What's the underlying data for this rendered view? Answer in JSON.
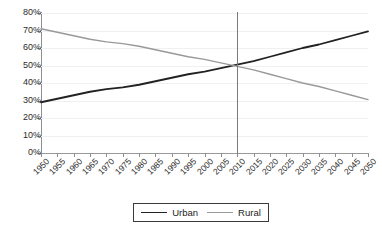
{
  "chart_data": {
    "type": "line",
    "title": "",
    "xlabel": "",
    "ylabel": "",
    "x": [
      1950,
      1955,
      1960,
      1965,
      1970,
      1975,
      1980,
      1985,
      1990,
      1995,
      2000,
      2005,
      2010,
      2015,
      2020,
      2025,
      2030,
      2035,
      2040,
      2045,
      2050
    ],
    "xticklabels": [
      "1950",
      "1955",
      "1960",
      "1965",
      "1970",
      "1975",
      "1980",
      "1985",
      "1990",
      "1995",
      "2000",
      "2005",
      "2010",
      "2015",
      "2020",
      "2025",
      "2030",
      "2035",
      "2040",
      "2045",
      "2050"
    ],
    "yticklabels": [
      "0%",
      "10%",
      "20%",
      "30%",
      "40%",
      "50%",
      "60%",
      "70%",
      "80%"
    ],
    "ytickvalues": [
      0,
      10,
      20,
      30,
      40,
      50,
      60,
      70,
      80
    ],
    "ylim": [
      0,
      80
    ],
    "xlim": [
      1950,
      2050
    ],
    "grid": true,
    "legend_position": "bottom-center",
    "series": [
      {
        "name": "Urban",
        "color": "#222222",
        "width": 1.8,
        "values": [
          29.0,
          31.0,
          33.0,
          35.0,
          36.5,
          37.5,
          39.0,
          41.0,
          43.0,
          45.0,
          46.5,
          48.5,
          50.5,
          52.5,
          55.0,
          57.5,
          60.0,
          62.0,
          64.5,
          67.0,
          69.5
        ]
      },
      {
        "name": "Rural",
        "color": "#999999",
        "width": 1.4,
        "values": [
          71.0,
          69.0,
          67.0,
          65.0,
          63.5,
          62.5,
          61.0,
          59.0,
          57.0,
          55.0,
          53.5,
          51.5,
          49.5,
          47.5,
          45.0,
          42.5,
          40.0,
          38.0,
          35.5,
          33.0,
          30.5
        ]
      }
    ],
    "annotations": [
      {
        "name": "crossover-marker",
        "type": "vline",
        "x": 2010,
        "value": 2010,
        "color": "#7a7a7a"
      }
    ]
  },
  "legend": {
    "entries": [
      {
        "label": "Urban",
        "color": "#222222"
      },
      {
        "label": "Rural",
        "color": "#999999"
      }
    ]
  }
}
